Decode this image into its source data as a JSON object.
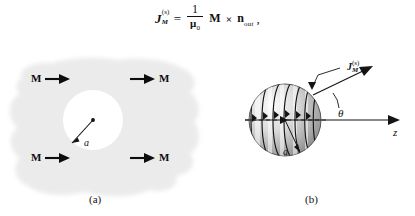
{
  "figure": {
    "equation": {
      "lhs_symbol": "J",
      "lhs_sub": "M",
      "lhs_sup": "(s)",
      "equals": "=",
      "fraction_numerator": "1",
      "fraction_denominator_symbol": "μ",
      "fraction_denominator_sub": "0",
      "magnetization_symbol": "M",
      "cross_operator": "×",
      "normal_symbol": "n",
      "normal_sub": "out",
      "trailing_punctuation": ","
    },
    "panel_a": {
      "caption": "(a)",
      "magnetization_labels": [
        {
          "text": "M",
          "position": "upper-left"
        },
        {
          "text": "M",
          "position": "upper-right"
        },
        {
          "text": "M",
          "position": "lower-left"
        },
        {
          "text": "M",
          "position": "lower-right"
        }
      ],
      "radius_label": "a",
      "region_color": "#ebebeb",
      "cavity_color": "#ffffff",
      "arrow_color": "#0d0d0d"
    },
    "panel_b": {
      "caption": "(b)",
      "surface_current_label_symbol": "J",
      "surface_current_label_sub": "M",
      "surface_current_label_sup": "(s)",
      "angle_label": "θ",
      "radius_label": "a",
      "axis_label": "z",
      "sphere_light_color": "#f2f2f2",
      "sphere_dark_color": "#8f8f8f",
      "line_color": "#111111"
    }
  }
}
